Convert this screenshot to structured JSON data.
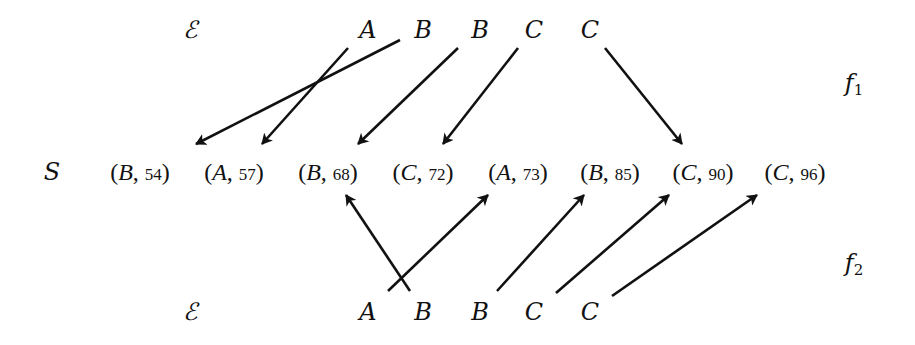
{
  "diagram": {
    "set_label": "S",
    "top_row": {
      "row_label": "ℰ",
      "function_label": "f",
      "function_index": "1",
      "items": [
        "A",
        "B",
        "B",
        "C",
        "C"
      ]
    },
    "bottom_row": {
      "row_label": "ℰ",
      "function_label": "f",
      "function_index": "2",
      "items": [
        "A",
        "B",
        "B",
        "C",
        "C"
      ]
    },
    "sequence": [
      {
        "symbol": "B",
        "value": "54"
      },
      {
        "symbol": "A",
        "value": "57"
      },
      {
        "symbol": "B",
        "value": "68"
      },
      {
        "symbol": "C",
        "value": "72"
      },
      {
        "symbol": "A",
        "value": "73"
      },
      {
        "symbol": "B",
        "value": "85"
      },
      {
        "symbol": "C",
        "value": "90"
      },
      {
        "symbol": "C",
        "value": "96"
      }
    ],
    "mappings": {
      "f1": [
        {
          "from": "A",
          "to": "(A, 57)"
        },
        {
          "from": "B",
          "to": "(B, 54)"
        },
        {
          "from": "B",
          "to": "(B, 68)"
        },
        {
          "from": "C",
          "to": "(C, 72)"
        },
        {
          "from": "C",
          "to": "(C, 90)"
        }
      ],
      "f2": [
        {
          "from": "A",
          "to": "(A, 73)"
        },
        {
          "from": "B",
          "to": "(B, 68)"
        },
        {
          "from": "B",
          "to": "(B, 85)"
        },
        {
          "from": "C",
          "to": "(C, 90)"
        },
        {
          "from": "C",
          "to": "(C, 96)"
        }
      ]
    },
    "colors": {
      "ink": "#111111",
      "background": "#ffffff"
    }
  }
}
